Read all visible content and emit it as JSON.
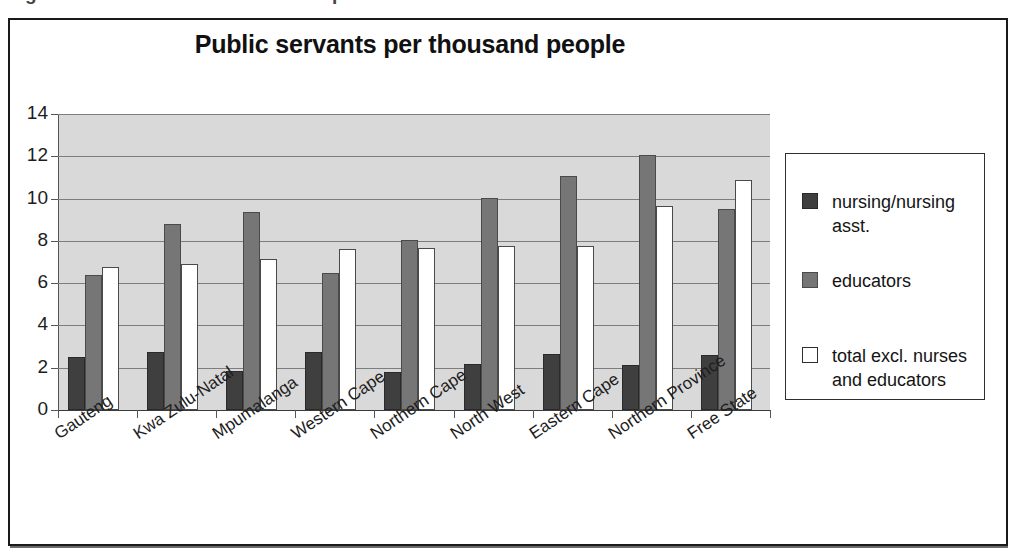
{
  "caption": {
    "text": "Figure 5.4    Provincial distribution of public servants"
  },
  "figure": {
    "title": "Public servants per thousand people"
  },
  "legend": {
    "position": "right",
    "items": [
      {
        "label": "nursing/nursing asst.",
        "swatch": "legend-swatch-dark",
        "color": "#3f3f3f"
      },
      {
        "label": "educators",
        "swatch": "legend-swatch-gray",
        "color": "#767676"
      },
      {
        "label": "total excl. nurses and educators",
        "swatch": "legend-swatch-white",
        "color": "#ffffff"
      }
    ]
  },
  "axes": {
    "y_ticks": [
      "0",
      "2",
      "4",
      "6",
      "8",
      "10",
      "12",
      "14"
    ]
  },
  "chart_data": {
    "type": "bar",
    "title": "Public servants per thousand people",
    "xlabel": "",
    "ylabel": "",
    "ylim": [
      0,
      14
    ],
    "ytick_step": 2,
    "grid": true,
    "legend_position": "right",
    "plot_background": "#d9d9d9",
    "categories": [
      "Gauteng",
      "Kwa Zulu-Natal",
      "Mpumalanga",
      "Western Cape",
      "Northern Cape",
      "North West",
      "Eastern Cape",
      "Northern Province",
      "Free State"
    ],
    "series": [
      {
        "name": "nursing/nursing asst.",
        "color": "#3f3f3f",
        "values": [
          2.5,
          2.75,
          1.85,
          2.75,
          1.8,
          2.2,
          2.65,
          2.15,
          2.6
        ]
      },
      {
        "name": "educators",
        "color": "#767676",
        "values": [
          6.4,
          8.8,
          9.35,
          6.5,
          8.05,
          10.05,
          11.05,
          12.05,
          9.5
        ]
      },
      {
        "name": "total excl. nurses and educators",
        "color": "#ffffff",
        "values": [
          6.75,
          6.9,
          7.15,
          7.6,
          7.65,
          7.75,
          7.75,
          9.65,
          10.9
        ]
      }
    ]
  }
}
